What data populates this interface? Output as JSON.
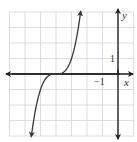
{
  "chart_data": {
    "type": "line",
    "title": "",
    "function": "y = (x + 4)^3",
    "xlabel": "x",
    "ylabel": "y",
    "xlim": [
      -7,
      1
    ],
    "ylim": [
      -4,
      4
    ],
    "grid": true,
    "tick_labels": {
      "x": [
        "-1"
      ],
      "y": [
        "1"
      ]
    },
    "series": [
      {
        "name": "curve",
        "x": [
          -5.59,
          -5.5,
          -5,
          -4.5,
          -4,
          -3.5,
          -3,
          -2.5,
          -2.41
        ],
        "y": [
          -4.0,
          -3.375,
          -1,
          -0.125,
          0,
          0.125,
          1,
          3.375,
          4.0
        ]
      }
    ],
    "colors": {
      "curve": "#3a3a3a",
      "axes": "#222222",
      "grid": "#d6d6d6"
    }
  },
  "labels": {
    "x_axis": "x",
    "y_axis": "y",
    "x_tick": "−1",
    "y_tick": "1"
  }
}
